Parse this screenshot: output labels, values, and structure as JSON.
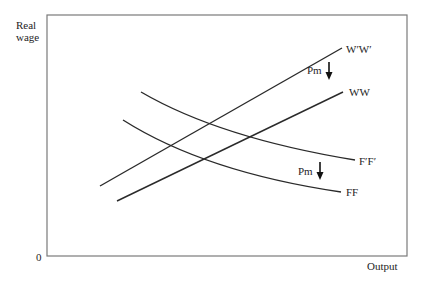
{
  "axes": {
    "y_label_line1": "Real",
    "y_label_line2": "wage",
    "x_label": "Output",
    "origin_label": "0"
  },
  "curves": [
    {
      "id": "wpwp",
      "label": "W′W′",
      "type": "line",
      "points": [
        [
          100,
          186
        ],
        [
          342,
          48
        ]
      ]
    },
    {
      "id": "ww",
      "label": "WW",
      "type": "line",
      "points": [
        [
          117,
          201
        ],
        [
          343,
          92
        ]
      ]
    },
    {
      "id": "fpfp",
      "label": "F′F′",
      "type": "curve",
      "points": [
        [
          141,
          92
        ],
        [
          240,
          130
        ],
        [
          355,
          160
        ]
      ]
    },
    {
      "id": "ff",
      "label": "FF",
      "type": "curve",
      "points": [
        [
          123,
          120
        ],
        [
          220,
          170
        ],
        [
          341,
          192
        ]
      ]
    }
  ],
  "annotations": [
    {
      "id": "pm-upper",
      "label": "Pm",
      "direction": "down"
    },
    {
      "id": "pm-lower",
      "label": "Pm",
      "direction": "down"
    }
  ],
  "colors": {
    "line": "#2a2a2a",
    "frame": "#7a7a7a"
  }
}
